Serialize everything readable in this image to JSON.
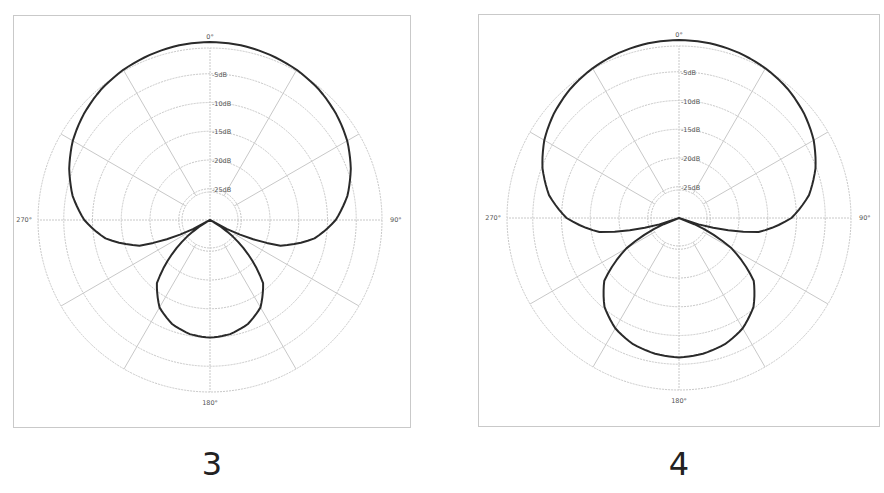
{
  "chart_data": [
    {
      "type": "polar",
      "caption": "3",
      "title": "",
      "angle_labels": {
        "top": "0°",
        "right": "90°",
        "bottom": "180°",
        "left": "270°"
      },
      "ring_labels": [
        "-5dB",
        "-10dB",
        "-15dB",
        "-20dB",
        "-25dB"
      ],
      "rings_db": [
        0,
        -5,
        -10,
        -15,
        -20,
        -25
      ],
      "spokes_deg": [
        0,
        30,
        60,
        90,
        120,
        150,
        180,
        210,
        240,
        270,
        300,
        330
      ],
      "rlim_db": [
        -30,
        0
      ],
      "series": [
        {
          "name": "pattern-3",
          "angles_deg": [
            0,
            10,
            20,
            30,
            40,
            50,
            60,
            70,
            80,
            90,
            100,
            110,
            120,
            130,
            140,
            150,
            160,
            170,
            180
          ],
          "values_db": [
            0,
            -0.1,
            -0.4,
            -0.8,
            -1.4,
            -2.3,
            -3.4,
            -4.9,
            -6.7,
            -9.1,
            -12.5,
            -17.9,
            -30,
            -23.4,
            -16.6,
            -13.4,
            -11.7,
            -10.8,
            -10.5
          ],
          "symmetric": true
        }
      ]
    },
    {
      "type": "polar",
      "caption": "4",
      "title": "",
      "angle_labels": {
        "top": "0°",
        "right": "90°",
        "bottom": "180°",
        "left": "270°"
      },
      "ring_labels": [
        "-5dB",
        "-10dB",
        "-15dB",
        "-20dB",
        "-25dB"
      ],
      "rings_db": [
        0,
        -5,
        -10,
        -15,
        -20,
        -25
      ],
      "spokes_deg": [
        0,
        30,
        60,
        90,
        120,
        150,
        180,
        210,
        240,
        270,
        300,
        330
      ],
      "rlim_db": [
        -30,
        0
      ],
      "series": [
        {
          "name": "pattern-4",
          "angles_deg": [
            0,
            10,
            20,
            30,
            40,
            50,
            60,
            70,
            80,
            90,
            100,
            110,
            120,
            130,
            140,
            150,
            160,
            170,
            180
          ],
          "values_db": [
            0,
            -0.1,
            -0.4,
            -0.9,
            -1.6,
            -2.6,
            -3.9,
            -5.7,
            -8.0,
            -11.4,
            -16.9,
            -30,
            -20.4,
            -14.0,
            -10.8,
            -8.8,
            -7.6,
            -7.0,
            -6.7
          ],
          "symmetric": true
        }
      ]
    }
  ],
  "style": {
    "grid_color": "#c8c8c8",
    "curve_color": "#2a2a2a",
    "frame_color": "#c9c9c9",
    "label_color": "#555555"
  }
}
